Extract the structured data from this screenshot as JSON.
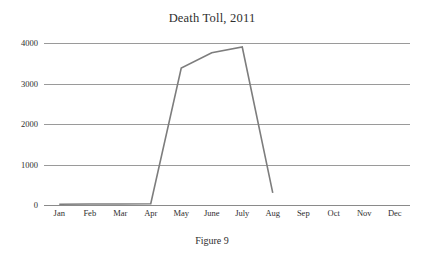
{
  "figure": {
    "caption": "Figure 9"
  },
  "chart_data": {
    "type": "line",
    "title": "Death Toll, 2011",
    "xlabel": "",
    "ylabel": "",
    "categories": [
      "Jan",
      "Feb",
      "Mar",
      "Apr",
      "May",
      "June",
      "July",
      "Aug",
      "Sep",
      "Oct",
      "Nov",
      "Dec"
    ],
    "values": [
      20,
      25,
      25,
      30,
      3380,
      3760,
      3900,
      300,
      null,
      null,
      null,
      null
    ],
    "series": [
      {
        "name": "Death Toll",
        "values": [
          20,
          25,
          25,
          30,
          3380,
          3760,
          3900,
          300,
          null,
          null,
          null,
          null
        ],
        "color": "#7d7d7d"
      }
    ],
    "ylim": [
      0,
      4000
    ],
    "y_ticks": [
      0,
      1000,
      2000,
      3000,
      4000
    ],
    "y_tick_labels": [
      "0",
      "1000",
      "2000",
      "3000",
      "4000"
    ],
    "grid": true,
    "grid_axis": "y",
    "legend": false,
    "legend_position": "none",
    "note": "Series line terminates between July and Aug; no data plotted for Sep through Dec."
  },
  "colors": {
    "line": "#7d7d7d",
    "grid": "#9a9a9a",
    "text": "#2e2e2e",
    "background": "#ffffff"
  }
}
